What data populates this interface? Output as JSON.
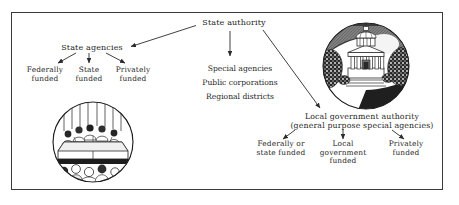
{
  "figure": {
    "background_color": "#ffffff",
    "ink_color": "#262626",
    "frame_color": "#3a3a3a"
  },
  "nodes": {
    "state_authority": "State authority",
    "state_agencies": "State agencies",
    "local_government_authority": "Local government authority\n(general purpose special agencies)"
  },
  "state_agency_children": [
    {
      "label": "Federally\nfunded"
    },
    {
      "label": "State\nfunded"
    },
    {
      "label": "Privately\nfunded"
    }
  ],
  "center_list": [
    "Special agencies",
    "Public corporations",
    "Regional districts"
  ],
  "local_government_children": [
    {
      "label": "Federally or\nstate funded"
    },
    {
      "label": "Local\ngovernment\nfunded"
    },
    {
      "label": "Privately\nfunded"
    }
  ],
  "illustrations": [
    {
      "name": "capitol-building-vignette",
      "caption": "Domed capitol building with columns framed by trees in a circular engraving"
    },
    {
      "name": "council-meeting-vignette",
      "caption": "Council members seated behind a curved dais facing an audience in a circular engraving"
    }
  ]
}
